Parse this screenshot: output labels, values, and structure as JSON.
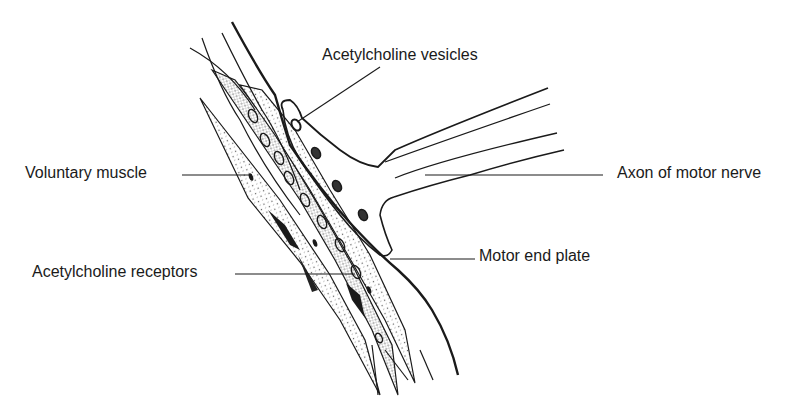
{
  "diagram": {
    "labels": {
      "acetylcholine_vesicles": "Acetylcholine vesicles",
      "voluntary_muscle": "Voluntary muscle",
      "axon_of_motor_nerve": "Axon of motor nerve",
      "motor_end_plate": "Motor end plate",
      "acetylcholine_receptors": "Acetylcholine receptors"
    },
    "colors": {
      "ink": "#1a1a1a",
      "background": "#ffffff",
      "stipple": "#555555"
    }
  }
}
